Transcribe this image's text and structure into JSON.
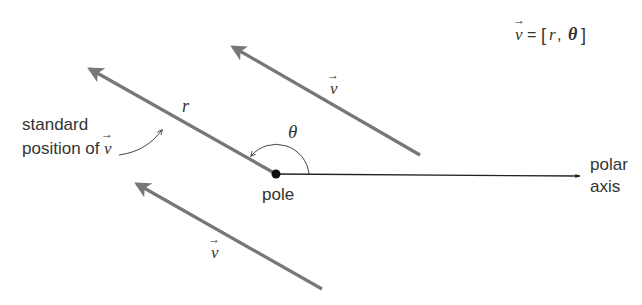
{
  "diagram": {
    "type": "polar-vector-diagram",
    "equation": {
      "vector": "v",
      "equals": "=",
      "open_bracket": "[",
      "r": "r",
      "comma": ",",
      "theta": "θ",
      "close_bracket": "]"
    },
    "labels": {
      "standard_line1": "standard",
      "standard_line2": "position of",
      "standard_vector": "v",
      "r": "r",
      "theta": "θ",
      "pole": "pole",
      "polar_line1": "polar",
      "polar_line2": "axis",
      "vector_upper": "v",
      "vector_lower": "v"
    },
    "arrow_glyph": "→",
    "colors": {
      "vector_stroke": "#777777",
      "axis_stroke": "#222222",
      "pole_fill": "#111111",
      "text": "#333333"
    }
  }
}
